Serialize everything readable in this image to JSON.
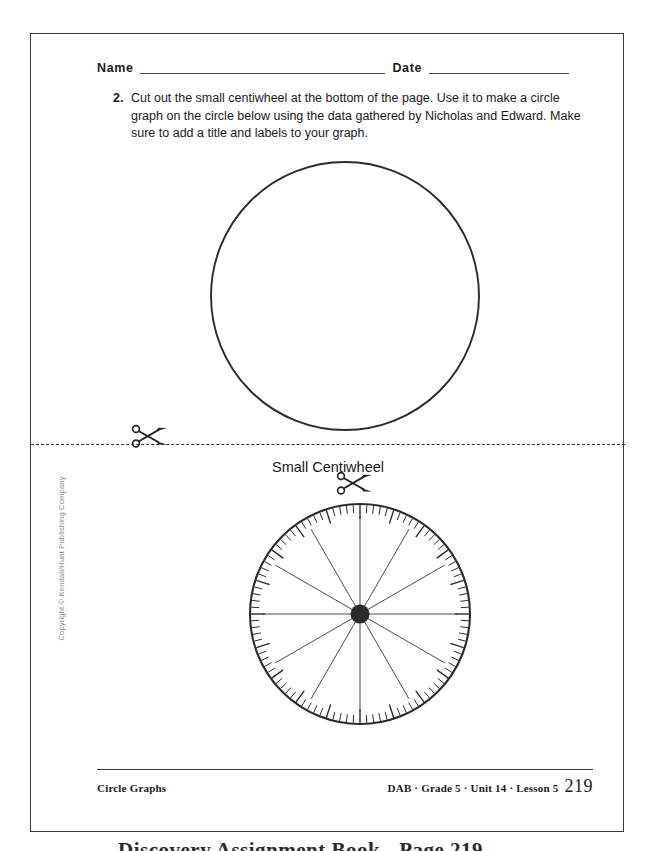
{
  "page": {
    "header": {
      "name_label": "Name",
      "date_label": "Date"
    },
    "instruction": {
      "number": "2.",
      "text": "Cut out the small centiwheel at the bottom of the page. Use it to make a circle graph on the circle below using the data gathered by Nicholas and Edward. Make sure to add a title and labels to your graph."
    },
    "big_circle": {
      "label": "empty circle for circle graph"
    },
    "cut_line": {
      "icon": "scissors-icon",
      "style": "dashed"
    },
    "centiwheel": {
      "caption": "Small Centiwheel",
      "icon": "scissors-icon",
      "tick_count": 100,
      "major_tick_every": 5,
      "spoke_count": 12
    },
    "footer": {
      "left": "Circle Graphs",
      "crumbs": "DAB · Grade 5 · Unit 14 · Lesson 5",
      "page_number": "219"
    },
    "copyright": "Copyright © Kendall/Hunt Publishing Company",
    "below_sheet_caption": "Discovery Assignment Book - Page 219"
  },
  "colors": {
    "ink": "#1a1a1a",
    "rule": "#3a3a3a",
    "circle_stroke": "#2c2c2c",
    "copyright_gray": "#8a8a8a",
    "paper": "#ffffff"
  }
}
